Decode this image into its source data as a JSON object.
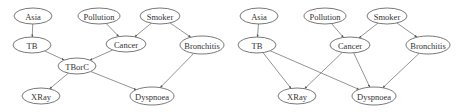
{
  "diagrams": [
    {
      "id": "left",
      "nodes": [
        {
          "id": "asia",
          "label": "Asia",
          "x": 33,
          "y": 16,
          "rx": 19,
          "ry": 8
        },
        {
          "id": "tb",
          "label": "TB",
          "x": 32,
          "y": 45,
          "rx": 19,
          "ry": 8
        },
        {
          "id": "pollution",
          "label": "Pollution",
          "x": 99,
          "y": 16,
          "rx": 21,
          "ry": 8
        },
        {
          "id": "smoker",
          "label": "Smoker",
          "x": 160,
          "y": 16,
          "rx": 20,
          "ry": 8
        },
        {
          "id": "cancer",
          "label": "Cancer",
          "x": 126,
          "y": 44,
          "rx": 20,
          "ry": 8
        },
        {
          "id": "bronchitis",
          "label": "Bronchitis",
          "x": 202,
          "y": 45,
          "rx": 22,
          "ry": 9
        },
        {
          "id": "tborc",
          "label": "TBorC",
          "x": 77,
          "y": 66,
          "rx": 19,
          "ry": 8
        },
        {
          "id": "xray",
          "label": "XRay",
          "x": 41,
          "y": 96,
          "rx": 19,
          "ry": 8
        },
        {
          "id": "dyspnoea",
          "label": "Dyspnoea",
          "x": 152,
          "y": 96,
          "rx": 22,
          "ry": 9
        }
      ],
      "edges": [
        [
          "asia",
          "tb"
        ],
        [
          "pollution",
          "cancer"
        ],
        [
          "smoker",
          "cancer"
        ],
        [
          "smoker",
          "bronchitis"
        ],
        [
          "tb",
          "tborc"
        ],
        [
          "cancer",
          "tborc"
        ],
        [
          "tborc",
          "xray"
        ],
        [
          "tborc",
          "dyspnoea"
        ],
        [
          "bronchitis",
          "dyspnoea"
        ]
      ]
    },
    {
      "id": "right",
      "nodes": [
        {
          "id": "asia",
          "label": "Asia",
          "x": 259,
          "y": 16,
          "rx": 19,
          "ry": 8
        },
        {
          "id": "tb",
          "label": "TB",
          "x": 257,
          "y": 45,
          "rx": 19,
          "ry": 8
        },
        {
          "id": "pollution",
          "label": "Pollution",
          "x": 325,
          "y": 16,
          "rx": 21,
          "ry": 8
        },
        {
          "id": "smoker",
          "label": "Smoker",
          "x": 387,
          "y": 16,
          "rx": 20,
          "ry": 8
        },
        {
          "id": "cancer",
          "label": "Cancer",
          "x": 350,
          "y": 45,
          "rx": 20,
          "ry": 8
        },
        {
          "id": "bronchitis",
          "label": "Bronchitis",
          "x": 428,
          "y": 45,
          "rx": 22,
          "ry": 9
        },
        {
          "id": "xray",
          "label": "XRay",
          "x": 297,
          "y": 96,
          "rx": 19,
          "ry": 8
        },
        {
          "id": "dyspnoea",
          "label": "Dyspnoea",
          "x": 374,
          "y": 96,
          "rx": 22,
          "ry": 9
        }
      ],
      "edges": [
        [
          "asia",
          "tb"
        ],
        [
          "pollution",
          "cancer"
        ],
        [
          "smoker",
          "cancer"
        ],
        [
          "smoker",
          "bronchitis"
        ],
        [
          "tb",
          "xray"
        ],
        [
          "tb",
          "dyspnoea"
        ],
        [
          "cancer",
          "xray"
        ],
        [
          "cancer",
          "dyspnoea"
        ],
        [
          "bronchitis",
          "dyspnoea"
        ]
      ]
    }
  ]
}
